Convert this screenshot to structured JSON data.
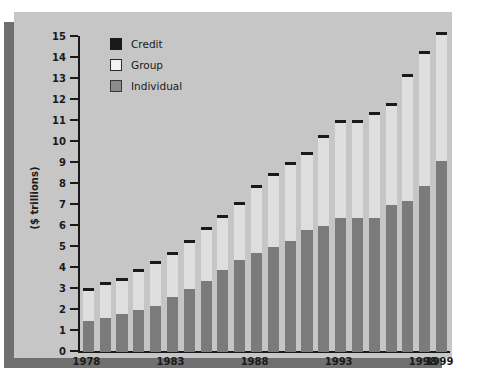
{
  "chart_data": {
    "type": "bar",
    "subtype": "stacked",
    "title": "",
    "xlabel": "",
    "ylabel": "($ trillions)",
    "ylim": [
      0,
      15
    ],
    "ytick_step": 1,
    "yticks": [
      "0",
      "1",
      "2",
      "3",
      "4",
      "5",
      "6",
      "7",
      "8",
      "9",
      "10",
      "11",
      "12",
      "13",
      "14",
      "15"
    ],
    "grid": false,
    "legend_position": "top-left",
    "categories": [
      "1978",
      "1979",
      "1980",
      "1981",
      "1982",
      "1983",
      "1984",
      "1985",
      "1986",
      "1987",
      "1988",
      "1989",
      "1990",
      "1991",
      "1992",
      "1993",
      "1994",
      "1995",
      "1996",
      "1997",
      "1998",
      "1999"
    ],
    "xtick_labels": [
      "1978",
      "1983",
      "1988",
      "1993",
      "1998",
      "1999"
    ],
    "xtick_categories": [
      "1978",
      "1983",
      "1988",
      "1993",
      "1998",
      "1999"
    ],
    "series": [
      {
        "name": "Individual",
        "color": "#7b7b7b",
        "values": [
          1.5,
          1.6,
          1.8,
          2.0,
          2.2,
          2.6,
          3.0,
          3.4,
          3.9,
          4.4,
          4.7,
          5.0,
          5.3,
          5.8,
          6.0,
          6.4,
          6.4,
          6.4,
          7.0,
          7.2,
          7.9,
          9.1
        ]
      },
      {
        "name": "Group",
        "color": "#dedede",
        "values": [
          1.4,
          1.6,
          1.6,
          1.8,
          2.0,
          2.0,
          2.2,
          2.4,
          2.5,
          2.6,
          3.1,
          3.4,
          3.6,
          3.6,
          4.2,
          4.5,
          4.5,
          4.9,
          4.7,
          5.9,
          6.3,
          6.0
        ]
      },
      {
        "name": "Credit",
        "color": "#1a1a1a",
        "values": [
          0.1,
          0.1,
          0.1,
          0.1,
          0.1,
          0.1,
          0.1,
          0.1,
          0.1,
          0.1,
          0.1,
          0.1,
          0.1,
          0.1,
          0.1,
          0.1,
          0.1,
          0.1,
          0.1,
          0.1,
          0.1,
          0.1
        ]
      }
    ],
    "totals": [
      3.0,
      3.3,
      3.5,
      3.9,
      4.3,
      4.7,
      5.3,
      5.9,
      6.5,
      7.1,
      7.9,
      8.5,
      9.0,
      9.5,
      10.3,
      11.0,
      11.0,
      11.4,
      11.8,
      13.2,
      14.3,
      15.2
    ]
  },
  "legend": {
    "items": [
      {
        "label": "Credit",
        "swatch": "credit-swatch"
      },
      {
        "label": "Group",
        "swatch": "group-swatch"
      },
      {
        "label": "Individual",
        "swatch": "individual-swatch"
      }
    ]
  },
  "axes": {
    "y_title": "($ trillions)"
  }
}
